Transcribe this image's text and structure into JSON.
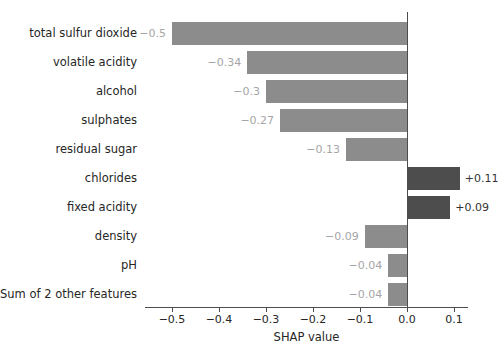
{
  "chart_data": {
    "type": "bar",
    "orientation": "horizontal",
    "title": "",
    "xlabel": "SHAP value",
    "ylabel": "",
    "xlim": [
      -0.557,
      0.13
    ],
    "xticks": [
      -0.5,
      -0.4,
      -0.3,
      -0.2,
      -0.1,
      0.0,
      0.1
    ],
    "xticklabels": [
      "−0.5",
      "−0.4",
      "−0.3",
      "−0.2",
      "−0.1",
      "0.0",
      "0.1"
    ],
    "grid": false,
    "legend": null,
    "zero_reference_line": 0.0,
    "categories": [
      "total sulfur dioxide",
      "volatile acidity",
      "alcohol",
      "sulphates",
      "residual sugar",
      "chlorides",
      "fixed acidity",
      "density",
      "pH",
      "Sum of 2 other features"
    ],
    "values": [
      -0.5,
      -0.34,
      -0.3,
      -0.27,
      -0.13,
      0.11,
      0.09,
      -0.09,
      -0.04,
      -0.04
    ],
    "value_labels": [
      "−0.5",
      "−0.34",
      "−0.3",
      "−0.27",
      "−0.13",
      "+0.11",
      "+0.09",
      "−0.09",
      "−0.04",
      "−0.04"
    ],
    "colors": {
      "negative_bar": "#8c8c8c",
      "positive_bar": "#4d4d4d",
      "negative_label": "#a6a6a6",
      "positive_label": "#333333",
      "axis": "#4d4d4d",
      "text": "#262626",
      "background": "#ffffff"
    }
  }
}
